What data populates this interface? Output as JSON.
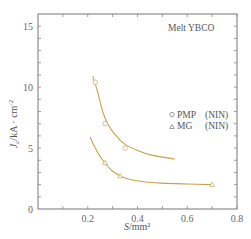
{
  "chart_data": {
    "type": "scatter",
    "title": "",
    "annotation": "Melt   YBCO",
    "xlabel": "S/mm²",
    "xlabel_italic": "S",
    "xlabel_unit": "/mm²",
    "ylabel": "Jc/kA · cm⁻²",
    "ylabel_italic": "J",
    "ylabel_sub": "c",
    "ylabel_unit": "/kA · cm",
    "ylabel_sup": "-2",
    "xlim": [
      0,
      0.8
    ],
    "ylim": [
      0,
      16
    ],
    "xticks": [
      0.2,
      0.4,
      0.6,
      0.8
    ],
    "xtick_labels": [
      "0.2",
      "0.4",
      "0.6",
      "0.8"
    ],
    "yticks": [
      0,
      5,
      10,
      15
    ],
    "ytick_labels": [
      "0",
      "5",
      "10",
      "15"
    ],
    "grid": false,
    "legend_position": "right-middle",
    "series": [
      {
        "name": "PMP",
        "label": "PMP",
        "tag": "(NIN)",
        "marker": "circle",
        "color": "#c8a24a",
        "points": [
          [
            0.23,
            10.4
          ],
          [
            0.27,
            7.0
          ],
          [
            0.35,
            5.0
          ]
        ],
        "fit_curve": [
          [
            0.22,
            10.9
          ],
          [
            0.24,
            9.6
          ],
          [
            0.26,
            8.0
          ],
          [
            0.28,
            7.0
          ],
          [
            0.31,
            6.1
          ],
          [
            0.35,
            5.3
          ],
          [
            0.4,
            4.8
          ],
          [
            0.46,
            4.4
          ],
          [
            0.55,
            4.1
          ]
        ]
      },
      {
        "name": "MG",
        "label": "MG",
        "tag": "(NIN)",
        "marker": "triangle",
        "color": "#c8a24a",
        "points": [
          [
            0.27,
            3.8
          ],
          [
            0.33,
            2.7
          ],
          [
            0.7,
            2.0
          ]
        ],
        "fit_curve": [
          [
            0.21,
            5.9
          ],
          [
            0.23,
            5.0
          ],
          [
            0.26,
            4.0
          ],
          [
            0.3,
            3.1
          ],
          [
            0.35,
            2.55
          ],
          [
            0.42,
            2.25
          ],
          [
            0.5,
            2.12
          ],
          [
            0.6,
            2.05
          ],
          [
            0.7,
            2.0
          ]
        ]
      }
    ]
  }
}
